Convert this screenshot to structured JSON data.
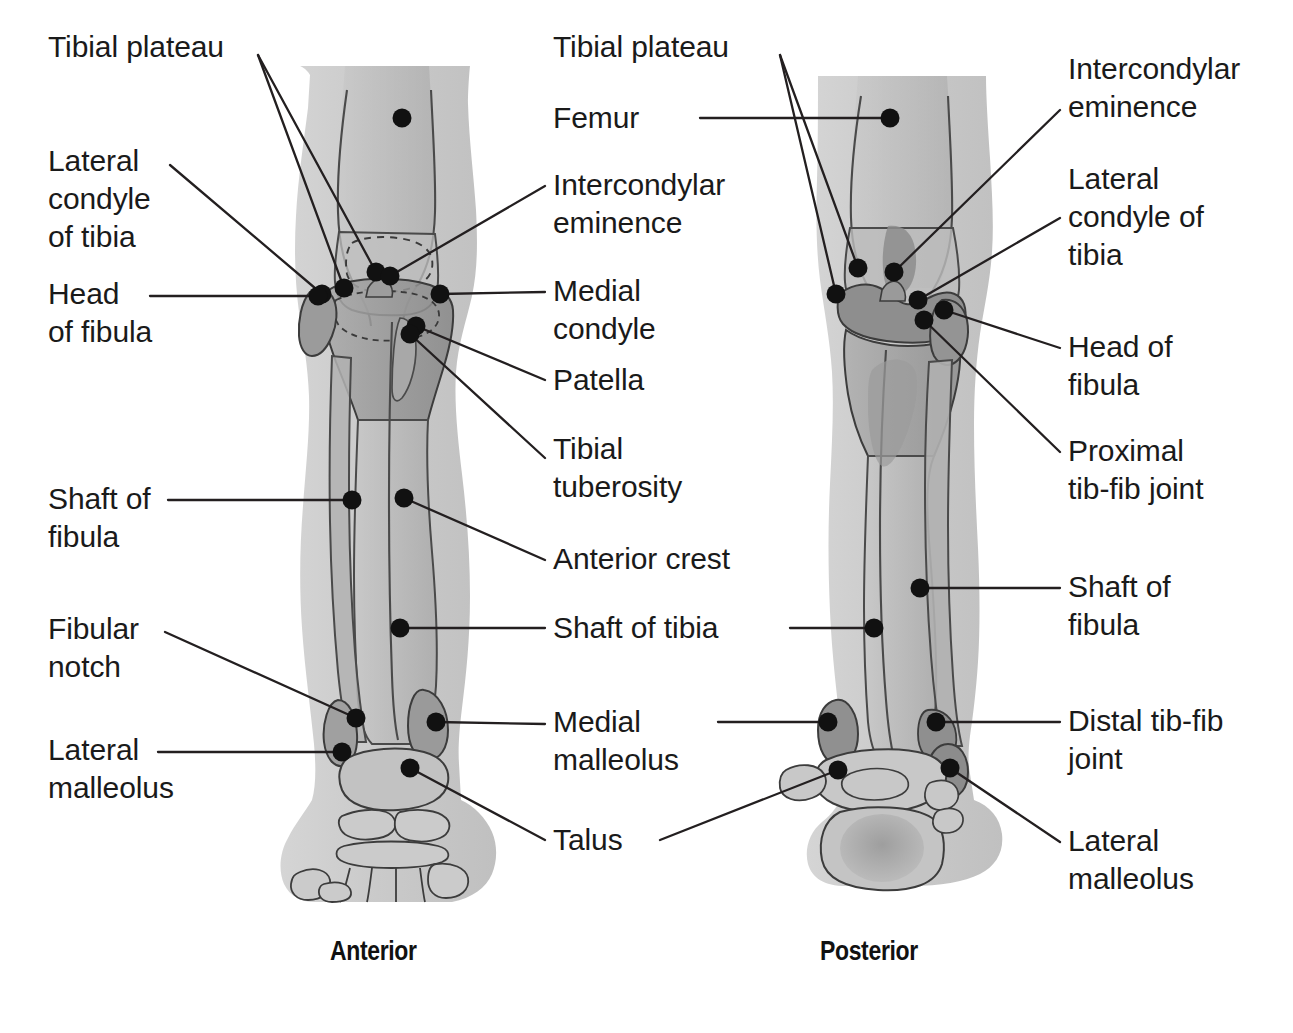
{
  "figure": {
    "background_color": "#ffffff",
    "text_color": "#1a1a1a",
    "line_color": "#231f20",
    "dot_color": "#111111",
    "soft_tissue_color": "#c9c9c9",
    "bone_fill_color": "#bdbdbd",
    "bone_shadow_color": "#9a9a9a",
    "bone_dark_color": "#868686"
  },
  "views": [
    {
      "id": "anterior",
      "caption": "Anterior"
    },
    {
      "id": "posterior",
      "caption": "Posterior"
    }
  ],
  "labels": {
    "left_column": [
      {
        "id": "tibial-plateau-left",
        "text": "Tibial plateau"
      },
      {
        "id": "lateral-condyle-of-tibia-left",
        "text": "Lateral\ncondyle\nof tibia"
      },
      {
        "id": "head-of-fibula-left",
        "text": "Head\nof fibula"
      },
      {
        "id": "shaft-of-fibula-left",
        "text": "Shaft of\nfibula"
      },
      {
        "id": "fibular-notch",
        "text": "Fibular\nnotch"
      },
      {
        "id": "lateral-malleolus-left",
        "text": "Lateral\nmalleolus"
      }
    ],
    "center_column": [
      {
        "id": "tibial-plateau-center",
        "text": "Tibial plateau"
      },
      {
        "id": "femur",
        "text": "Femur"
      },
      {
        "id": "intercondylar-eminence-center",
        "text": "Intercondylar\neminence"
      },
      {
        "id": "medial-condyle",
        "text": "Medial\ncondyle"
      },
      {
        "id": "patella",
        "text": "Patella"
      },
      {
        "id": "tibial-tuberosity",
        "text": "Tibial\ntuberosity"
      },
      {
        "id": "anterior-crest",
        "text": "Anterior crest"
      },
      {
        "id": "shaft-of-tibia",
        "text": "Shaft of tibia"
      },
      {
        "id": "medial-malleolus",
        "text": "Medial\nmalleolus"
      },
      {
        "id": "talus",
        "text": "Talus"
      }
    ],
    "right_column": [
      {
        "id": "intercondylar-eminence-right",
        "text": "Intercondylar\neminence"
      },
      {
        "id": "lateral-condyle-of-tibia-right",
        "text": "Lateral\ncondyle of\ntibia"
      },
      {
        "id": "head-of-fibula-right",
        "text": "Head of\nfibula"
      },
      {
        "id": "proximal-tib-fib-joint",
        "text": "Proximal\ntib-fib joint"
      },
      {
        "id": "shaft-of-fibula-right",
        "text": "Shaft of\nfibula"
      },
      {
        "id": "distal-tib-fib-joint",
        "text": "Distal tib-fib\njoint"
      },
      {
        "id": "lateral-malleolus-right",
        "text": "Lateral\nmalleolus"
      }
    ]
  }
}
